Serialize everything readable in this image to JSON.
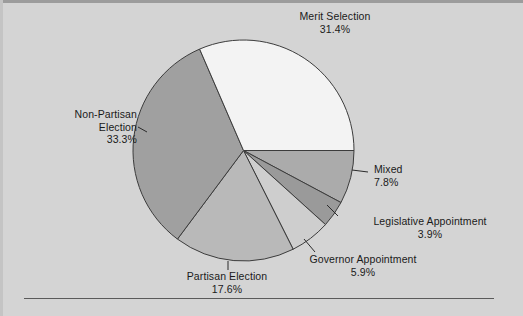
{
  "figure": {
    "background_color": "#d4d4d4",
    "footer_rule_color": "#5a5a5a",
    "footer_note": ""
  },
  "chart_data": {
    "type": "pie",
    "title": "",
    "subtitle": "",
    "xlabel": "",
    "ylabel": "",
    "legend_position": "none",
    "grid": false,
    "labels_outside": true,
    "start_angle_deg": 0,
    "direction": "clockwise",
    "center": {
      "x": 243.5,
      "y": 150.5
    },
    "radius": 110.5,
    "total_percent": 99.9,
    "value_suffix": "%",
    "categories": [
      "Mixed",
      "Legislative Appointment",
      "Governor Appointment",
      "Partisan Election",
      "Non-Partisan Election",
      "Merit Selection"
    ],
    "values": [
      7.8,
      3.9,
      5.9,
      17.6,
      33.3,
      31.4
    ],
    "value_labels": [
      "7.8%",
      "3.9%",
      "5.9%",
      "17.6%",
      "33.3%",
      "31.4%"
    ],
    "colors": [
      "#ababab",
      "#9a9a9a",
      "#cecece",
      "#b9b9b9",
      "#a0a0a0",
      "#f3f3f3"
    ],
    "slice_edge_color": "#3c3c3c",
    "slices": [
      {
        "name": "Mixed",
        "value": 7.8,
        "value_label": "7.8%",
        "color": "#ababab",
        "start_deg": 0.0,
        "sweep_deg": 28.1
      },
      {
        "name": "Legislative Appointment",
        "value": 3.9,
        "value_label": "3.9%",
        "color": "#9a9a9a",
        "start_deg": 28.1,
        "sweep_deg": 14.0
      },
      {
        "name": "Governor Appointment",
        "value": 5.9,
        "value_label": "5.9%",
        "color": "#cecece",
        "start_deg": 42.1,
        "sweep_deg": 21.2
      },
      {
        "name": "Partisan Election",
        "value": 17.6,
        "value_label": "17.6%",
        "color": "#b9b9b9",
        "start_deg": 63.3,
        "sweep_deg": 63.4
      },
      {
        "name": "Non-Partisan Election",
        "value": 33.3,
        "value_label": "33.3%",
        "color": "#a0a0a0",
        "start_deg": 126.7,
        "sweep_deg": 119.9
      },
      {
        "name": "Merit Selection",
        "value": 31.4,
        "value_label": "31.4%",
        "color": "#f3f3f3",
        "start_deg": 246.6,
        "sweep_deg": 113.4
      }
    ]
  },
  "labels": {
    "merit": {
      "name": "Merit Selection",
      "value": "31.4%"
    },
    "nonpartisan": {
      "name_line1": "Non-Partisan",
      "name_line2": "Election",
      "value": "33.3%"
    },
    "mixed": {
      "name": "Mixed",
      "value": "7.8%"
    },
    "legislative": {
      "name": "Legislative Appointment",
      "value": "3.9%"
    },
    "governor": {
      "name": "Governor Appointment",
      "value": "5.9%"
    },
    "partisan": {
      "name": "Partisan Election",
      "value": "17.6%"
    }
  }
}
